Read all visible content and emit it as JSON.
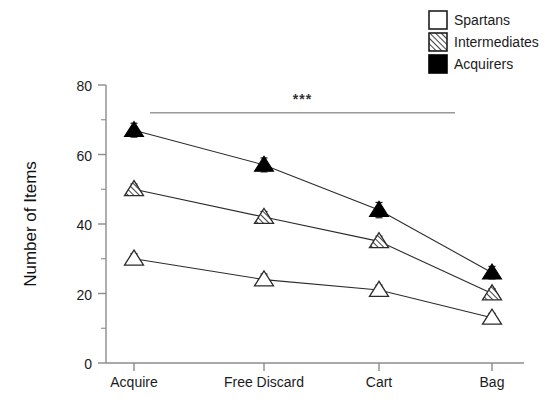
{
  "chart_data": {
    "type": "line",
    "title": "",
    "subtitle": "",
    "xlabel": "",
    "ylabel": "Number of Items",
    "categories": [
      "Acquire",
      "Free Discard",
      "Cart",
      "Bag"
    ],
    "ylim": [
      0,
      80
    ],
    "yticks": [
      0,
      20,
      40,
      60,
      80
    ],
    "ytick_labels": [
      "0",
      "20",
      "40",
      "60",
      "80"
    ],
    "yminor_ticks": [
      10,
      30,
      50,
      70
    ],
    "grid": false,
    "legend_position": "top-right",
    "series": [
      {
        "name": "Spartans",
        "marker": "triangle-open",
        "values": [
          30,
          24,
          21,
          13
        ],
        "errors": [
          1.5,
          1.6,
          1.4,
          1.3
        ]
      },
      {
        "name": "Intermediates",
        "marker": "triangle-hatched",
        "values": [
          50,
          42,
          35,
          20
        ],
        "errors": [
          1.5,
          1.6,
          1.5,
          1.4
        ]
      },
      {
        "name": "Acquirers",
        "marker": "triangle-filled",
        "values": [
          67,
          57,
          44,
          26
        ],
        "errors": [
          2.0,
          2.0,
          2.2,
          1.8
        ]
      }
    ],
    "annotations": [
      {
        "name": "significance-bracket",
        "text": "***",
        "from_category": "Acquire",
        "to_category": "Bag",
        "level": 72
      }
    ]
  },
  "legend": {
    "items": [
      {
        "label": "Spartans",
        "swatch": "open-square"
      },
      {
        "label": "Intermediates",
        "swatch": "hatched-square"
      },
      {
        "label": "Acquirers",
        "swatch": "filled-square"
      }
    ]
  },
  "colors": {
    "axis": "#8c8c8c",
    "text": "#1b1b1b",
    "line": "#2b2b2b",
    "marker_fill_solid": "#000000",
    "marker_fill_open": "#ffffff",
    "significance": "#9a9a9a",
    "background": "#ffffff"
  }
}
